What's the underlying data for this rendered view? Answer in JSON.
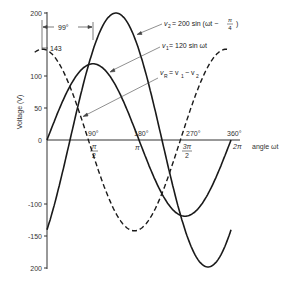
{
  "chart_data": {
    "type": "line",
    "title": "",
    "xlabel": "angle ωt",
    "ylabel": "Voltage (V)",
    "ylim": [
      -200,
      200
    ],
    "xlim_degrees": [
      0,
      360
    ],
    "y_ticks": [
      200,
      100,
      50,
      0,
      -100,
      -150,
      -200
    ],
    "y_tick_labels": [
      "200",
      "100",
      "50",
      "0",
      "-100",
      "-150",
      "200"
    ],
    "x_ticks_degrees": [
      90,
      180,
      270,
      360
    ],
    "x_tick_labels_degrees": [
      "90°",
      "180°",
      "270°",
      "360°"
    ],
    "x_tick_labels_radians": [
      "π/2",
      "π",
      "3π/2",
      "2π"
    ],
    "grid": false,
    "series": [
      {
        "name": "v2 = 200 sin (ωt − π/4)",
        "amplitude": 200,
        "phase_degrees": -45,
        "style": "solid",
        "x_degrees": [
          0,
          45,
          90,
          135,
          180,
          225,
          270,
          315,
          360
        ],
        "values": [
          -141,
          0,
          141,
          200,
          141,
          0,
          -141,
          -200,
          -141
        ]
      },
      {
        "name": "v1 = 120 sin ωt",
        "amplitude": 120,
        "phase_degrees": 0,
        "style": "solid",
        "x_degrees": [
          0,
          45,
          90,
          135,
          180,
          225,
          270,
          315,
          360
        ],
        "values": [
          0,
          85,
          120,
          85,
          0,
          -85,
          -120,
          -85,
          0
        ]
      },
      {
        "name": "vR = v1 − v2",
        "amplitude": 143,
        "phase_degrees": 99,
        "style": "dashed",
        "x_degrees": [
          -9,
          81,
          171,
          261,
          351
        ],
        "values": [
          143,
          0,
          -143,
          0,
          143
        ]
      }
    ],
    "annotations": [
      {
        "text": "99°",
        "type": "phase-difference-dimension"
      },
      {
        "text": "143",
        "type": "peak-value-marker"
      }
    ]
  },
  "labels": {
    "y_axis_title": "Voltage (V)",
    "x_axis_title": "angle ωt",
    "phase_diff": "99°",
    "peak_143": "143",
    "v2_label_v": "v",
    "v2_label_sub": "2",
    "v2_label_rest": "= 200 sin (ωt −",
    "v2_frac_num": "π",
    "v2_frac_den": "4",
    "v2_close": ")",
    "v1_label_v": "v",
    "v1_label_sub": "1",
    "v1_label_rest": "= 120 sin ωt",
    "vr_label_v": "v",
    "vr_label_sub": "R",
    "vr_label_mid": "= v",
    "vr_label_sub1": "1",
    "vr_label_minus": "− v",
    "vr_label_sub2": "2",
    "ytick_200": "200",
    "ytick_100": "100",
    "ytick_50": "50",
    "ytick_0": "0",
    "ytick_m100": "-100",
    "ytick_m150": "-150",
    "ytick_m200": "200",
    "xdeg_90": "90°",
    "xdeg_180": "180°",
    "xdeg_270": "270°",
    "xdeg_360": "360°",
    "xrad_90_num": "π",
    "xrad_90_den": "2",
    "xrad_180": "π",
    "xrad_270_num": "3π",
    "xrad_270_den": "2",
    "xrad_360": "2π"
  },
  "colors": {
    "curve": "#1a1a1a",
    "axis": "#333333",
    "annotation": "#444444"
  }
}
